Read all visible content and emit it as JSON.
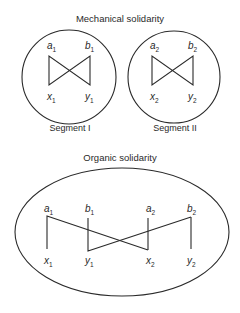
{
  "mechanical": {
    "title": "Mechanical solidarity",
    "segments": [
      {
        "label": "Segment I",
        "nodes": {
          "a": "a",
          "a_sub": "1",
          "b": "b",
          "b_sub": "1",
          "x": "x",
          "x_sub": "1",
          "y": "y",
          "y_sub": "1"
        }
      },
      {
        "label": "Segment II",
        "nodes": {
          "a": "a",
          "a_sub": "2",
          "b": "b",
          "b_sub": "2",
          "x": "x",
          "x_sub": "2",
          "y": "y",
          "y_sub": "2"
        }
      }
    ]
  },
  "organic": {
    "title": "Organic solidarity",
    "nodes": [
      {
        "top": "a",
        "top_sub": "1",
        "bottom": "x",
        "bottom_sub": "1"
      },
      {
        "top": "b",
        "top_sub": "1",
        "bottom": "y",
        "bottom_sub": "1"
      },
      {
        "top": "a",
        "top_sub": "2",
        "bottom": "x",
        "bottom_sub": "2"
      },
      {
        "top": "b",
        "top_sub": "2",
        "bottom": "y",
        "bottom_sub": "2"
      }
    ]
  }
}
